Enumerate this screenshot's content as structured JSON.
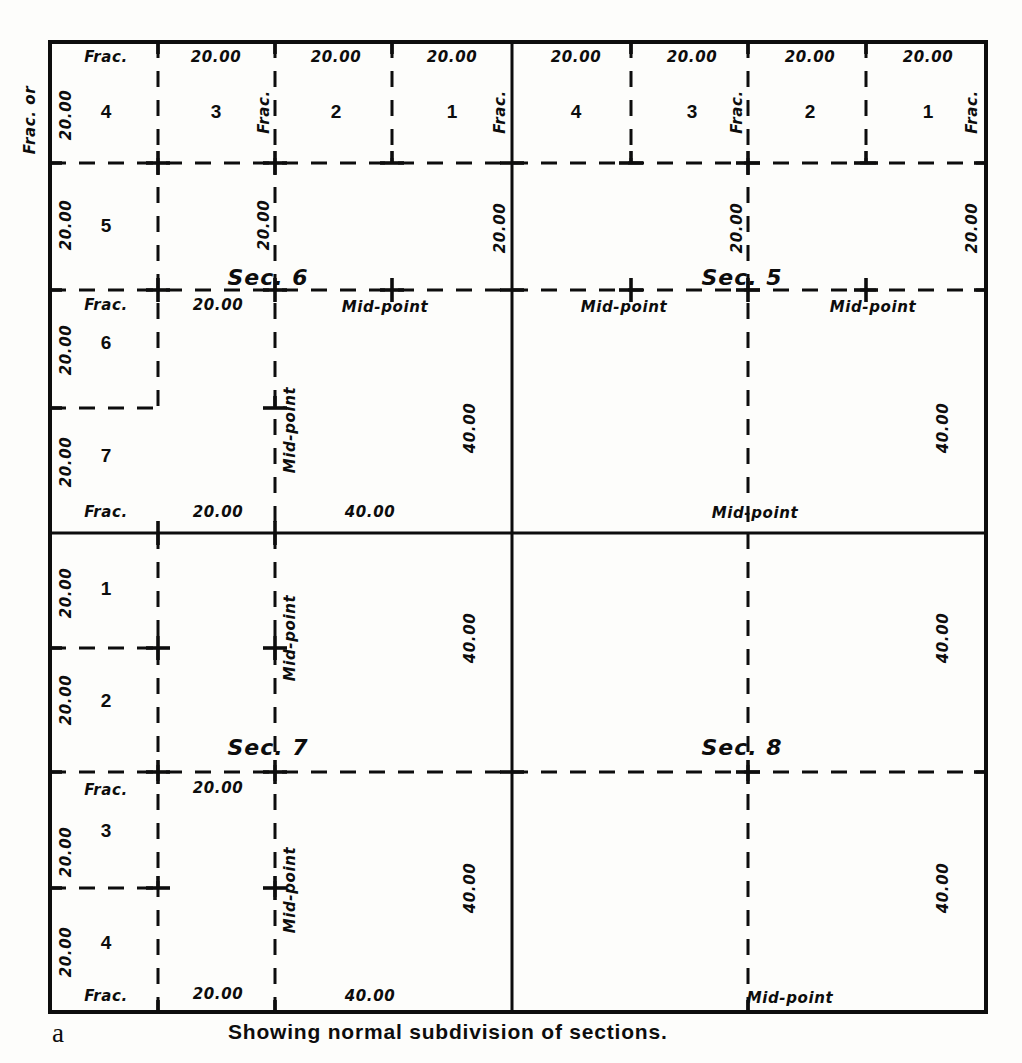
{
  "figure": {
    "panel_letter": "a",
    "caption": "Showing normal subdivision of sections.",
    "frame": {
      "left": 50,
      "top": 42,
      "right": 986,
      "bottom": 1012
    }
  },
  "colors": {
    "ink": "#0d0d0d",
    "paper": "#fdfdfb"
  },
  "labels": {
    "frac": "Frac.",
    "frac_or": "Frac. or",
    "twenty": "20.00",
    "forty": "40.00",
    "midpoint": "Mid-point"
  },
  "sections": [
    {
      "name": "Sec. 6",
      "quadrant": "top-left",
      "cx": 281,
      "cy": 284
    },
    {
      "name": "Sec. 5",
      "quadrant": "top-right",
      "cx": 755,
      "cy": 284
    },
    {
      "name": "Sec. 7",
      "quadrant": "bottom-left",
      "cx": 281,
      "cy": 754
    },
    {
      "name": "Sec. 8",
      "quadrant": "bottom-right",
      "cx": 755,
      "cy": 754
    }
  ],
  "lot_numbers": {
    "sec6_top_row": [
      "4",
      "3",
      "2",
      "1"
    ],
    "sec6_west_col": [
      "5",
      "6",
      "7"
    ],
    "sec5_top_row": [
      "4",
      "3",
      "2",
      "1"
    ],
    "sec7_west_col": [
      "1",
      "2",
      "3",
      "4"
    ]
  },
  "chart_data": {
    "type": "diagram",
    "title": "Showing normal subdivision of sections.",
    "sections": [
      {
        "id": "Sec. 6",
        "position": "top-left",
        "lots_top": [
          "4",
          "3",
          "2",
          "1"
        ],
        "lots_west": [
          "5",
          "6",
          "7"
        ],
        "top_dimensions": [
          "Frac.",
          "20.00",
          "20.00",
          "20.00"
        ],
        "west_dimensions": [
          "20.00",
          "20.00",
          "20.00",
          "20.00"
        ],
        "mid_row_dimensions": [
          "Frac.",
          "20.00",
          "Mid-point"
        ],
        "bottom_dimensions": [
          "Frac.",
          "20.00",
          "40.00"
        ],
        "east_dimensions": [
          "20.00",
          "40.00"
        ],
        "corner_labels": [
          "Frac.",
          "Frac."
        ],
        "midpoints": [
          "Mid-point",
          "Mid-point"
        ]
      },
      {
        "id": "Sec. 5",
        "position": "top-right",
        "lots_top": [
          "4",
          "3",
          "2",
          "1"
        ],
        "top_dimensions": [
          "20.00",
          "20.00",
          "20.00",
          "20.00"
        ],
        "west_dimensions": [
          "20.00"
        ],
        "east_dimensions": [
          "20.00",
          "40.00"
        ],
        "mid_row_dimensions": [
          "Mid-point",
          "Mid-point"
        ],
        "bottom_dimensions": [
          "Mid-point"
        ],
        "corner_labels": [
          "Frac.",
          "Frac."
        ]
      },
      {
        "id": "Sec. 7",
        "position": "bottom-left",
        "lots_west": [
          "1",
          "2",
          "3",
          "4"
        ],
        "west_dimensions": [
          "20.00",
          "20.00",
          "20.00",
          "20.00"
        ],
        "mid_row_dimensions": [
          "Frac.",
          "20.00"
        ],
        "bottom_dimensions": [
          "Frac.",
          "20.00",
          "40.00"
        ],
        "east_dimensions": [
          "40.00",
          "40.00"
        ],
        "midpoints": [
          "Mid-point",
          "Mid-point"
        ]
      },
      {
        "id": "Sec. 8",
        "position": "bottom-right",
        "east_dimensions": [
          "40.00",
          "40.00"
        ],
        "bottom_dimensions": [
          "Mid-point"
        ]
      }
    ],
    "legend": []
  },
  "annotations": [
    {
      "id": "a01",
      "text": "Frac. or",
      "x": 30,
      "y": 120,
      "rot": true,
      "kind": "dim"
    },
    {
      "id": "a02",
      "text": "20.00",
      "x": 66,
      "y": 115,
      "rot": true,
      "kind": "dim"
    },
    {
      "id": "a03",
      "text": "Frac.",
      "x": 106,
      "y": 57,
      "rot": false,
      "kind": "dim"
    },
    {
      "id": "a04",
      "text": "20.00",
      "x": 216,
      "y": 57,
      "rot": false,
      "kind": "dim"
    },
    {
      "id": "a05",
      "text": "20.00",
      "x": 336,
      "y": 57,
      "rot": false,
      "kind": "dim"
    },
    {
      "id": "a06",
      "text": "20.00",
      "x": 452,
      "y": 57,
      "rot": false,
      "kind": "dim"
    },
    {
      "id": "a07",
      "text": "Frac.",
      "x": 264,
      "y": 112,
      "rot": true,
      "kind": "dim"
    },
    {
      "id": "a08",
      "text": "Frac.",
      "x": 500,
      "y": 112,
      "rot": true,
      "kind": "dim"
    },
    {
      "id": "a09",
      "text": "4",
      "x": 106,
      "y": 111,
      "rot": false,
      "kind": "lot"
    },
    {
      "id": "a10",
      "text": "3",
      "x": 216,
      "y": 111,
      "rot": false,
      "kind": "lot"
    },
    {
      "id": "a11",
      "text": "2",
      "x": 336,
      "y": 111,
      "rot": false,
      "kind": "lot"
    },
    {
      "id": "a12",
      "text": "1",
      "x": 452,
      "y": 111,
      "rot": false,
      "kind": "lot"
    },
    {
      "id": "a13",
      "text": "20.00",
      "x": 576,
      "y": 57,
      "rot": false,
      "kind": "dim"
    },
    {
      "id": "a14",
      "text": "20.00",
      "x": 692,
      "y": 57,
      "rot": false,
      "kind": "dim"
    },
    {
      "id": "a15",
      "text": "20.00",
      "x": 810,
      "y": 57,
      "rot": false,
      "kind": "dim"
    },
    {
      "id": "a16",
      "text": "20.00",
      "x": 928,
      "y": 57,
      "rot": false,
      "kind": "dim"
    },
    {
      "id": "a17",
      "text": "Frac.",
      "x": 737,
      "y": 112,
      "rot": true,
      "kind": "dim"
    },
    {
      "id": "a18",
      "text": "Frac.",
      "x": 972,
      "y": 112,
      "rot": true,
      "kind": "dim"
    },
    {
      "id": "a19",
      "text": "4",
      "x": 576,
      "y": 111,
      "rot": false,
      "kind": "lot"
    },
    {
      "id": "a20",
      "text": "3",
      "x": 692,
      "y": 111,
      "rot": false,
      "kind": "lot"
    },
    {
      "id": "a21",
      "text": "2",
      "x": 810,
      "y": 111,
      "rot": false,
      "kind": "lot"
    },
    {
      "id": "a22",
      "text": "1",
      "x": 928,
      "y": 111,
      "rot": false,
      "kind": "lot"
    },
    {
      "id": "a23",
      "text": "20.00",
      "x": 66,
      "y": 225,
      "rot": true,
      "kind": "dim"
    },
    {
      "id": "a24",
      "text": "5",
      "x": 106,
      "y": 225,
      "rot": false,
      "kind": "lot"
    },
    {
      "id": "a25",
      "text": "20.00",
      "x": 264,
      "y": 225,
      "rot": true,
      "kind": "dim"
    },
    {
      "id": "a26",
      "text": "20.00",
      "x": 500,
      "y": 228,
      "rot": true,
      "kind": "dim"
    },
    {
      "id": "a27",
      "text": "20.00",
      "x": 737,
      "y": 228,
      "rot": true,
      "kind": "dim"
    },
    {
      "id": "a28",
      "text": "20.00",
      "x": 972,
      "y": 228,
      "rot": true,
      "kind": "dim"
    },
    {
      "id": "a29",
      "text": "Sec. 6",
      "x": 268,
      "y": 278,
      "rot": false,
      "kind": "sec"
    },
    {
      "id": "a30",
      "text": "Sec. 5",
      "x": 742,
      "y": 278,
      "rot": false,
      "kind": "sec"
    },
    {
      "id": "a31",
      "text": "Frac.",
      "x": 106,
      "y": 305,
      "rot": false,
      "kind": "dim"
    },
    {
      "id": "a32",
      "text": "20.00",
      "x": 218,
      "y": 305,
      "rot": false,
      "kind": "dim"
    },
    {
      "id": "a33",
      "text": "Mid-point",
      "x": 385,
      "y": 307,
      "rot": false,
      "kind": "dim"
    },
    {
      "id": "a34",
      "text": "Mid-point",
      "x": 624,
      "y": 307,
      "rot": false,
      "kind": "dim"
    },
    {
      "id": "a35",
      "text": "Mid-point",
      "x": 873,
      "y": 307,
      "rot": false,
      "kind": "dim"
    },
    {
      "id": "a36",
      "text": "20.00",
      "x": 66,
      "y": 350,
      "rot": true,
      "kind": "dim"
    },
    {
      "id": "a37",
      "text": "6",
      "x": 106,
      "y": 342,
      "rot": false,
      "kind": "lot"
    },
    {
      "id": "a38",
      "text": "20.00",
      "x": 66,
      "y": 462,
      "rot": true,
      "kind": "dim"
    },
    {
      "id": "a39",
      "text": "7",
      "x": 106,
      "y": 455,
      "rot": false,
      "kind": "lot"
    },
    {
      "id": "a40",
      "text": "Mid-point",
      "x": 290,
      "y": 430,
      "rot": true,
      "kind": "dim"
    },
    {
      "id": "a41",
      "text": "40.00",
      "x": 470,
      "y": 428,
      "rot": true,
      "kind": "dim"
    },
    {
      "id": "a42",
      "text": "40.00",
      "x": 943,
      "y": 428,
      "rot": true,
      "kind": "dim"
    },
    {
      "id": "a43",
      "text": "Frac.",
      "x": 106,
      "y": 512,
      "rot": false,
      "kind": "dim"
    },
    {
      "id": "a44",
      "text": "20.00",
      "x": 218,
      "y": 512,
      "rot": false,
      "kind": "dim"
    },
    {
      "id": "a45",
      "text": "40.00",
      "x": 370,
      "y": 512,
      "rot": false,
      "kind": "dim"
    },
    {
      "id": "a46",
      "text": "Mid-point",
      "x": 755,
      "y": 513,
      "rot": false,
      "kind": "dim"
    },
    {
      "id": "a47",
      "text": "20.00",
      "x": 66,
      "y": 593,
      "rot": true,
      "kind": "dim"
    },
    {
      "id": "a48",
      "text": "1",
      "x": 106,
      "y": 588,
      "rot": false,
      "kind": "lot"
    },
    {
      "id": "a49",
      "text": "20.00",
      "x": 66,
      "y": 700,
      "rot": true,
      "kind": "dim"
    },
    {
      "id": "a50",
      "text": "2",
      "x": 106,
      "y": 700,
      "rot": false,
      "kind": "lot"
    },
    {
      "id": "a51",
      "text": "Mid-point",
      "x": 290,
      "y": 638,
      "rot": true,
      "kind": "dim"
    },
    {
      "id": "a52",
      "text": "40.00",
      "x": 470,
      "y": 638,
      "rot": true,
      "kind": "dim"
    },
    {
      "id": "a53",
      "text": "40.00",
      "x": 943,
      "y": 638,
      "rot": true,
      "kind": "dim"
    },
    {
      "id": "a54",
      "text": "Sec. 7",
      "x": 268,
      "y": 748,
      "rot": false,
      "kind": "sec"
    },
    {
      "id": "a55",
      "text": "Sec. 8",
      "x": 742,
      "y": 748,
      "rot": false,
      "kind": "sec"
    },
    {
      "id": "a56",
      "text": "Frac.",
      "x": 106,
      "y": 790,
      "rot": false,
      "kind": "dim"
    },
    {
      "id": "a57",
      "text": "20.00",
      "x": 218,
      "y": 788,
      "rot": false,
      "kind": "dim"
    },
    {
      "id": "a58",
      "text": "20.00",
      "x": 66,
      "y": 852,
      "rot": true,
      "kind": "dim"
    },
    {
      "id": "a59",
      "text": "3",
      "x": 106,
      "y": 830,
      "rot": false,
      "kind": "lot"
    },
    {
      "id": "a60",
      "text": "20.00",
      "x": 66,
      "y": 952,
      "rot": true,
      "kind": "dim"
    },
    {
      "id": "a61",
      "text": "4",
      "x": 106,
      "y": 942,
      "rot": false,
      "kind": "lot"
    },
    {
      "id": "a62",
      "text": "Mid-point",
      "x": 290,
      "y": 890,
      "rot": true,
      "kind": "dim"
    },
    {
      "id": "a63",
      "text": "40.00",
      "x": 470,
      "y": 888,
      "rot": true,
      "kind": "dim"
    },
    {
      "id": "a64",
      "text": "40.00",
      "x": 943,
      "y": 888,
      "rot": true,
      "kind": "dim"
    },
    {
      "id": "a65",
      "text": "Frac.",
      "x": 106,
      "y": 996,
      "rot": false,
      "kind": "dim"
    },
    {
      "id": "a66",
      "text": "20.00",
      "x": 218,
      "y": 994,
      "rot": false,
      "kind": "dim"
    },
    {
      "id": "a67",
      "text": "40.00",
      "x": 370,
      "y": 996,
      "rot": false,
      "kind": "dim"
    },
    {
      "id": "a68",
      "text": "Mid-point",
      "x": 790,
      "y": 998,
      "rot": false,
      "kind": "dim"
    }
  ]
}
